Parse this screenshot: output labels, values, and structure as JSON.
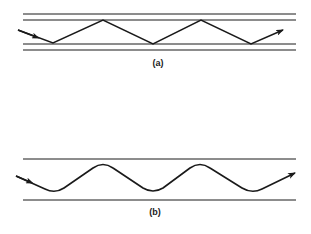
{
  "diagram": {
    "panels": [
      {
        "id": "a",
        "caption": "(a)",
        "description": "Ray undergoing total internal reflection in a step-index waveguide (zig-zag path between cladding boundaries)",
        "boundary_lines_y": [
          14,
          20,
          44,
          50
        ],
        "ray_points": [
          [
            18,
            30
          ],
          [
            53,
            43
          ],
          [
            103,
            20
          ],
          [
            153,
            44
          ],
          [
            201,
            20
          ],
          [
            251,
            44
          ],
          [
            283,
            30
          ]
        ]
      },
      {
        "id": "b",
        "caption": "(b)",
        "description": "Ray following a smooth sinusoidal path in a graded-index waveguide",
        "boundary_lines_y": [
          159,
          200
        ],
        "ray_crests_x": [
          103,
          200
        ],
        "ray_troughs_x": [
          55,
          153,
          252
        ]
      }
    ],
    "colors": {
      "line": "#1a1a1a",
      "background": "#ffffff"
    }
  }
}
